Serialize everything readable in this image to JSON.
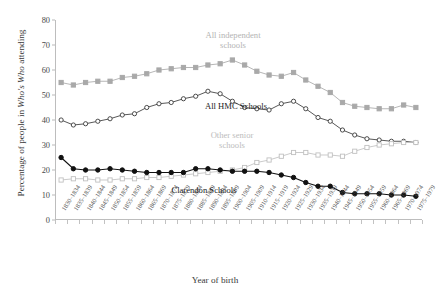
{
  "axes": {
    "y_label_prefix": "Percentage of people in ",
    "y_label_italic": "Who's Who",
    "y_label_suffix": " attending",
    "x_label": "Year of birth"
  },
  "annotations": {
    "independent": "All independent\nschools",
    "independent_line1": "All independent",
    "independent_line2": "schools",
    "hmc": "All HMC Schools",
    "other_line1": "Other senior",
    "other_line2": "schools",
    "clarendon": "Clarendon Schools"
  },
  "colors": {
    "independent": "#a9a9a9",
    "hmc": "#3a3a3a",
    "other": "#c0c0c0",
    "clarendon": "#111111",
    "axis": "#bdbdbd"
  },
  "chart_data": {
    "type": "line",
    "title": "",
    "xlabel": "Year of birth",
    "ylabel": "Percentage of people in Who's Who attending",
    "ylim": [
      0,
      80
    ],
    "yticks": [
      0,
      10,
      20,
      30,
      40,
      50,
      60,
      70,
      80
    ],
    "grid": false,
    "legend": "inline-annotations",
    "categories": [
      "1830–1834",
      "1835–1839",
      "1840–1844",
      "1845–1849",
      "1850–1854",
      "1855–1859",
      "1860–1864",
      "1865–1869",
      "1870–1874",
      "1875–1879",
      "1880–1884",
      "1885–1889",
      "1890–1894",
      "1895–1899",
      "1900–1904",
      "1905–1909",
      "1910–1914",
      "1915–1919",
      "1920–1924",
      "1925–1929",
      "1930–1934",
      "1935–1939",
      "1940–1944",
      "1945–1949",
      "1950–1954",
      "1955–1959",
      "1960–1964",
      "1965–1969",
      "1970–1974",
      "1975–1979"
    ],
    "series": [
      {
        "name": "All independent schools",
        "marker": "filled-square",
        "color": "#a9a9a9",
        "values": [
          55,
          54,
          55,
          55.5,
          55.5,
          57,
          57.5,
          58.5,
          60,
          60.5,
          61,
          61,
          62,
          62.5,
          64,
          62,
          59.5,
          58,
          57.5,
          59,
          56,
          53.5,
          51,
          47,
          45.5,
          45,
          44.5,
          44.5,
          46,
          45
        ]
      },
      {
        "name": "All HMC Schools",
        "marker": "open-circle",
        "color": "#3a3a3a",
        "values": [
          40,
          38,
          38.5,
          39.5,
          40.5,
          42,
          42.5,
          45,
          46.5,
          47,
          48.5,
          49.5,
          51.5,
          50.5,
          47.5,
          45,
          44.5,
          44,
          46.5,
          47.5,
          44.5,
          41,
          39.5,
          36,
          34,
          32.5,
          32,
          31.5,
          31.5,
          31
        ]
      },
      {
        "name": "Other senior schools",
        "marker": "open-square",
        "color": "#c0c0c0",
        "values": [
          16,
          16.5,
          16.5,
          16,
          16,
          16.5,
          16.5,
          17,
          17,
          17.5,
          18,
          18.5,
          19,
          19.5,
          20,
          21,
          23,
          24,
          25.5,
          27,
          27,
          26,
          26,
          25.5,
          27.5,
          29,
          30,
          30.5,
          31,
          31
        ]
      },
      {
        "name": "Clarendon Schools",
        "marker": "filled-circle",
        "color": "#111111",
        "values": [
          25,
          20.5,
          20,
          20,
          20.5,
          20,
          19.5,
          19,
          19,
          19,
          19,
          20.5,
          20.5,
          20,
          19.5,
          19.5,
          19.5,
          19,
          18,
          17,
          15,
          13.5,
          13.5,
          11,
          10.5,
          10.5,
          10.5,
          10,
          10,
          9.5
        ]
      }
    ]
  }
}
